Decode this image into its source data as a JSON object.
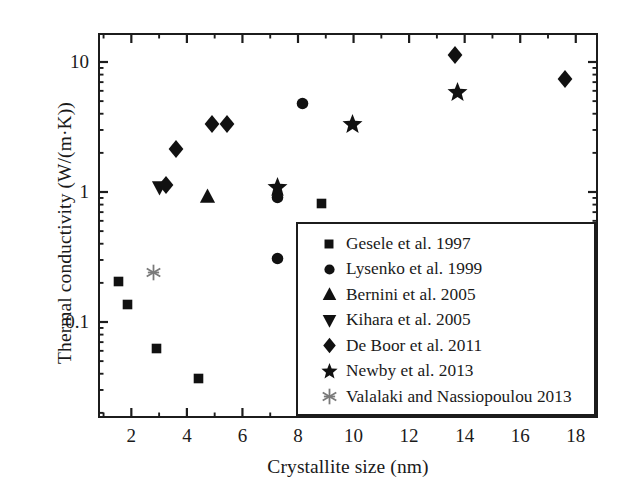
{
  "chart_data": {
    "type": "scatter",
    "title": "",
    "xlabel": "Crystallite size (nm)",
    "ylabel": "Thermal conductivity (W/(m·K))",
    "xscale": "linear",
    "yscale": "log",
    "xlim": [
      0.8,
      18.8
    ],
    "ylim": [
      0.027,
      19.5
    ],
    "xticks": [
      2,
      4,
      6,
      8,
      10,
      12,
      14,
      16,
      18
    ],
    "xticklabels": [
      "2",
      "4",
      "6",
      "8",
      "10",
      "12",
      "14",
      "16",
      "18"
    ],
    "xminor_ticks": [
      1,
      3,
      5,
      7,
      9,
      11,
      13,
      15,
      17
    ],
    "yticks": [
      0.1,
      1,
      10
    ],
    "yticklabels": [
      "0.1",
      "1",
      "10"
    ],
    "grid": false,
    "legend_position": "lower right",
    "series": [
      {
        "name": "Gesele et al. 1997",
        "marker": "square",
        "color": "#111111",
        "points": [
          {
            "x": 1.55,
            "y": 0.205
          },
          {
            "x": 1.85,
            "y": 0.137
          },
          {
            "x": 2.9,
            "y": 0.063
          },
          {
            "x": 4.4,
            "y": 0.037
          },
          {
            "x": 8.85,
            "y": 0.82
          }
        ]
      },
      {
        "name": "Lysenko et al. 1999",
        "marker": "circle",
        "color": "#111111",
        "points": [
          {
            "x": 7.25,
            "y": 0.31
          },
          {
            "x": 7.25,
            "y": 0.9
          },
          {
            "x": 8.15,
            "y": 4.8
          }
        ]
      },
      {
        "name": "Bernini et al. 2005",
        "marker": "triangle-up",
        "color": "#111111",
        "points": [
          {
            "x": 4.75,
            "y": 0.93
          }
        ]
      },
      {
        "name": "Kihara et al. 2005",
        "marker": "triangle-down",
        "color": "#111111",
        "points": [
          {
            "x": 3.0,
            "y": 1.09
          }
        ]
      },
      {
        "name": "De Boor et al. 2011",
        "marker": "diamond",
        "color": "#111111",
        "points": [
          {
            "x": 3.25,
            "y": 1.13
          },
          {
            "x": 3.6,
            "y": 2.15
          },
          {
            "x": 4.9,
            "y": 3.35
          },
          {
            "x": 5.45,
            "y": 3.35
          },
          {
            "x": 13.65,
            "y": 11.3
          },
          {
            "x": 17.6,
            "y": 7.4
          }
        ]
      },
      {
        "name": "Newby et al. 2013",
        "marker": "star",
        "color": "#111111",
        "points": [
          {
            "x": 7.25,
            "y": 1.09
          },
          {
            "x": 9.95,
            "y": 3.3
          },
          {
            "x": 13.75,
            "y": 5.8
          }
        ]
      },
      {
        "name": "Valalaki and Nassiopoulou 2013",
        "marker": "asterisk",
        "color": "#7a7a7a",
        "points": [
          {
            "x": 2.8,
            "y": 0.24
          }
        ]
      }
    ]
  },
  "axes": {
    "xlabel": "Crystallite size (nm)",
    "ylabel": "Thermal conductivity (W/(m·K))",
    "xticklabels": [
      "2",
      "4",
      "6",
      "8",
      "10",
      "12",
      "14",
      "16",
      "18"
    ],
    "yticklabels": [
      "10",
      "1",
      "0.1"
    ]
  },
  "legend": {
    "entries": [
      {
        "label": "Gesele et al. 1997",
        "marker": "square"
      },
      {
        "label": "Lysenko et al. 1999",
        "marker": "circle"
      },
      {
        "label": "Bernini et al. 2005",
        "marker": "triangle-up"
      },
      {
        "label": "Kihara et al. 2005",
        "marker": "triangle-down"
      },
      {
        "label": "De Boor et al. 2011",
        "marker": "diamond"
      },
      {
        "label": "Newby et al. 2013",
        "marker": "star"
      },
      {
        "label": "Valalaki and Nassiopoulou 2013",
        "marker": "asterisk"
      }
    ]
  },
  "colors": {
    "marker": "#111111",
    "asterisk": "#7a7a7a",
    "axis": "#1c1c1c",
    "background": "#ffffff"
  }
}
